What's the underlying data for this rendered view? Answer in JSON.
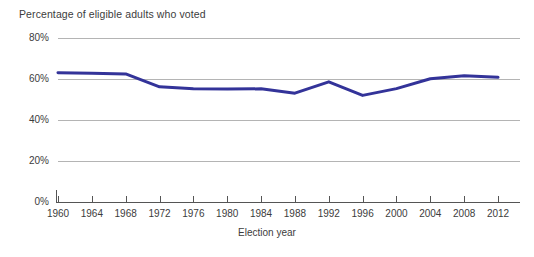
{
  "chart_data": {
    "type": "line",
    "title": "Percentage of eligible adults who voted",
    "xlabel": "Election year",
    "ylabel": "",
    "x": [
      1960,
      1964,
      1968,
      1972,
      1976,
      1980,
      1984,
      1988,
      1992,
      1996,
      2000,
      2004,
      2008,
      2012
    ],
    "categories": [
      "1960",
      "1964",
      "1968",
      "1972",
      "1976",
      "1980",
      "1984",
      "1988",
      "1992",
      "1996",
      "2000",
      "2004",
      "2008",
      "2012"
    ],
    "values": [
      63.1,
      62.8,
      62.5,
      56.2,
      55.2,
      55.1,
      55.2,
      53.1,
      58.6,
      52.0,
      55.3,
      60.1,
      61.6,
      60.8
    ],
    "series": [
      {
        "name": "Percentage of eligible adults who voted",
        "values": [
          63.1,
          62.8,
          62.5,
          56.2,
          55.2,
          55.1,
          55.2,
          53.1,
          58.6,
          52.0,
          55.3,
          60.1,
          61.6,
          60.8
        ]
      }
    ],
    "xlim": [
      1960,
      2012
    ],
    "ylim": [
      0,
      80
    ],
    "y_ticks": [
      0,
      20,
      40,
      60,
      80
    ],
    "y_tick_labels": [
      "0%",
      "20%",
      "40%",
      "60%",
      "80%"
    ],
    "x_ticks": [
      1960,
      1964,
      1968,
      1972,
      1976,
      1980,
      1984,
      1988,
      1992,
      1996,
      2000,
      2004,
      2008,
      2012
    ],
    "grid": true,
    "grid_axis": "y",
    "legend": false,
    "legend_position": "none",
    "line_color": "#333399",
    "grid_color": "#b4b4b4",
    "axis_color": "#555555",
    "background": "#ffffff",
    "line_width": 3
  }
}
